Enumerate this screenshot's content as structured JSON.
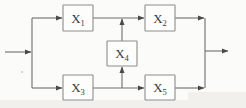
{
  "diagram": {
    "type": "block-diagram",
    "background_color": "#fbfbf9",
    "line_color": "#6e6e6e",
    "box_stroke_color": "#8d8d8d",
    "box_fill_color": "#fdfdfc",
    "label_color": "#3a3a3a",
    "blocks": [
      {
        "id": "X1",
        "base": "X",
        "sub": "1",
        "x": 63,
        "y": 5,
        "w": 30,
        "h": 26
      },
      {
        "id": "X2",
        "base": "X",
        "sub": "2",
        "x": 145,
        "y": 5,
        "w": 30,
        "h": 26
      },
      {
        "id": "X4",
        "base": "X",
        "sub": "4",
        "x": 107,
        "y": 41,
        "w": 30,
        "h": 25
      },
      {
        "id": "X3",
        "base": "X",
        "sub": "3",
        "x": 63,
        "y": 75,
        "w": 30,
        "h": 25
      },
      {
        "id": "X5",
        "base": "X",
        "sub": "5",
        "x": 145,
        "y": 75,
        "w": 30,
        "h": 25
      }
    ],
    "nodes": {
      "input_split_x": 32,
      "output_merge_x": 205,
      "top_rail_y": 18,
      "bottom_rail_y": 88,
      "mid_rail_y": 52,
      "branch_x": 122
    },
    "edges": [
      {
        "name": "input-arrow",
        "from": "input",
        "to": "split-node"
      },
      {
        "name": "split-to-x1",
        "from": "split-node",
        "to": "X1"
      },
      {
        "name": "split-to-x3",
        "from": "split-node",
        "to": "X3"
      },
      {
        "name": "x1-to-x2",
        "from": "X1",
        "to": "X2"
      },
      {
        "name": "x3-to-x5",
        "from": "X3",
        "to": "X5"
      },
      {
        "name": "x4-to-top-rail",
        "from": "X4",
        "to": "top-rail"
      },
      {
        "name": "bottom-rail-to-x4",
        "from": "bottom-rail",
        "to": "X4"
      },
      {
        "name": "x2-to-merge",
        "from": "X2",
        "to": "merge-node"
      },
      {
        "name": "x5-to-merge",
        "from": "X5",
        "to": "merge-node"
      },
      {
        "name": "output-arrow",
        "from": "merge-node",
        "to": "output"
      }
    ],
    "arrow_count": 10,
    "block_count": 5
  }
}
